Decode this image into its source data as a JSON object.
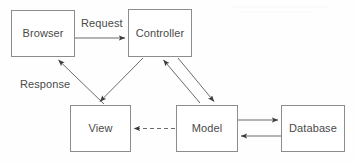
{
  "diagram": {
    "background_color": "#fefefe",
    "box_border_color": "#8c8c8c",
    "line_color": "#6b6b6b",
    "text_color": "#4a4a4a",
    "nodes": [
      {
        "id": "browser",
        "label": "Browser",
        "x": 11,
        "y": 10,
        "w": 64,
        "h": 47
      },
      {
        "id": "controller",
        "label": "Controller",
        "x": 128,
        "y": 9,
        "w": 64,
        "h": 48
      },
      {
        "id": "view",
        "label": "View",
        "x": 70,
        "y": 105,
        "w": 61,
        "h": 47
      },
      {
        "id": "model",
        "label": "Model",
        "x": 176,
        "y": 105,
        "w": 62,
        "h": 47
      },
      {
        "id": "database",
        "label": "Database",
        "x": 281,
        "y": 105,
        "w": 64,
        "h": 47
      }
    ],
    "edges": [
      {
        "id": "browser-to-controller",
        "from": "browser",
        "to": "controller",
        "label": "Request",
        "style": "solid",
        "arrow": "end"
      },
      {
        "id": "view-to-browser",
        "from": "view",
        "to": "browser",
        "label": "Response",
        "style": "solid",
        "arrow": "end"
      },
      {
        "id": "controller-to-view",
        "from": "controller",
        "to": "view",
        "label": "",
        "style": "solid",
        "arrow": "end"
      },
      {
        "id": "model-to-controller",
        "from": "model",
        "to": "controller",
        "label": "",
        "style": "solid",
        "arrow": "end"
      },
      {
        "id": "controller-to-model",
        "from": "controller",
        "to": "model",
        "label": "",
        "style": "solid",
        "arrow": "end"
      },
      {
        "id": "model-to-view",
        "from": "model",
        "to": "view",
        "label": "",
        "style": "dashed",
        "arrow": "end"
      },
      {
        "id": "model-to-database",
        "from": "model",
        "to": "database",
        "label": "",
        "style": "solid",
        "arrow": "end"
      },
      {
        "id": "database-to-model",
        "from": "database",
        "to": "model",
        "label": "",
        "style": "solid",
        "arrow": "end"
      }
    ],
    "edge_labels": {
      "request": "Request",
      "response": "Response"
    }
  }
}
